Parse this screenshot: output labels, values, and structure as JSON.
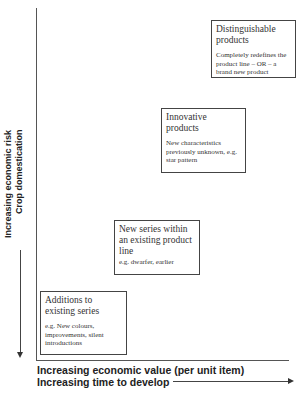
{
  "diagram": {
    "type": "staircase-matrix",
    "y_axis": {
      "label_line1": "Increasing economic risk",
      "label_line2": "Crop domestication",
      "arrow_direction": "down"
    },
    "x_axis": {
      "label_line1": "Increasing economic value (per unit item)",
      "label_line2": "Increasing time to develop",
      "arrow_direction": "right"
    },
    "boxes": [
      {
        "title": "Additions to existing series",
        "description": "e.g. New colours, improvements, silent introductions"
      },
      {
        "title": "New series within an existing product line",
        "description": "e.g. dwarfer, earlier"
      },
      {
        "title": "Innovative products",
        "description": "New characteristics previously unknown, e.g. star pattern"
      },
      {
        "title": "Distinguishable products",
        "description": "Completely redefines the product line – OR – a brand new product"
      }
    ]
  }
}
